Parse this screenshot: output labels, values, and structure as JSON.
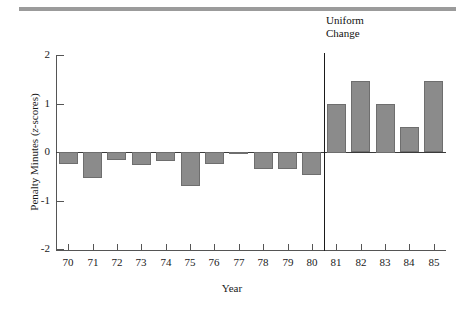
{
  "chart_data": {
    "type": "bar",
    "title": "",
    "xlabel": "Year",
    "ylabel": "Penalty Minutes (z-scores)",
    "ylabel_parts": {
      "main": "Penalty Minutes (",
      "italic": "z",
      "tail": "-scores)"
    },
    "categories": [
      "70",
      "71",
      "72",
      "73",
      "74",
      "75",
      "76",
      "77",
      "78",
      "79",
      "80",
      "81",
      "82",
      "83",
      "84",
      "85"
    ],
    "values": [
      -0.25,
      -0.53,
      -0.17,
      -0.26,
      -0.18,
      -0.7,
      -0.25,
      -0.05,
      -0.35,
      -0.35,
      -0.47,
      1.0,
      1.47,
      1.0,
      0.52,
      1.47
    ],
    "ylim": [
      -2,
      2
    ],
    "yticks": [
      "2",
      "1",
      "0",
      "-1",
      "-2"
    ],
    "ytick_values": [
      2,
      1,
      0,
      -1,
      -2
    ],
    "grid": false,
    "legend": "none",
    "bar_color": "#8b8b8b",
    "bar_edge_color": "#6e6e6e",
    "axis_color": "#555555",
    "annotations": [
      {
        "name": "uniform-change",
        "text": "Uniform\nChange",
        "x_between": [
          "80",
          "81"
        ],
        "line": true
      }
    ]
  },
  "decor": {
    "top_rule_color": "#9b9b9b"
  }
}
